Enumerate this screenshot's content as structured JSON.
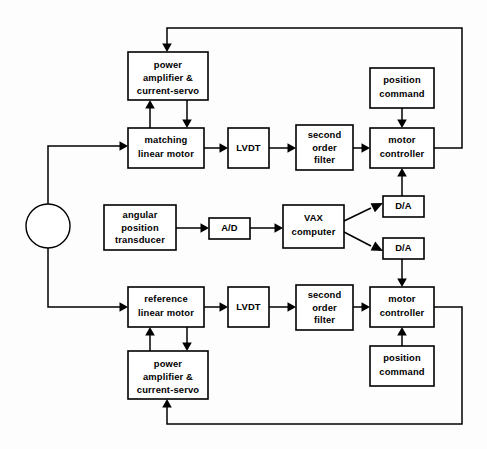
{
  "figure": {
    "kind": "control-system-block-diagram",
    "title": "",
    "background_color": "#fdfdfd",
    "line_color": "#000000",
    "box_fill": "#ffffff"
  },
  "nodes": {
    "summing_junction": {
      "shape": "circle",
      "label": ""
    },
    "top_power_amplifier": {
      "lines": [
        "power",
        "amplifier  &",
        "current-servo"
      ]
    },
    "matching_linear_motor": {
      "lines": [
        "matching",
        "linear motor"
      ]
    },
    "top_lvdt": {
      "lines": [
        "LVDT"
      ]
    },
    "top_second_order_filter": {
      "lines": [
        "second",
        "order",
        "filter"
      ]
    },
    "top_motor_controller": {
      "lines": [
        "motor",
        "controller"
      ]
    },
    "top_position_command": {
      "lines": [
        "position",
        "command"
      ]
    },
    "angular_position_transducer": {
      "lines": [
        "angular",
        "position",
        "transducer"
      ]
    },
    "ad_converter": {
      "lines": [
        "A/D"
      ]
    },
    "vax_computer": {
      "lines": [
        "VAX",
        "computer"
      ]
    },
    "da_converter_top": {
      "lines": [
        "D/A"
      ]
    },
    "da_converter_bottom": {
      "lines": [
        "D/A"
      ]
    },
    "reference_linear_motor": {
      "lines": [
        "reference",
        "linear  motor"
      ]
    },
    "bottom_lvdt": {
      "lines": [
        "LVDT"
      ]
    },
    "bottom_second_order_filter": {
      "lines": [
        "second",
        "order",
        "filter"
      ]
    },
    "bottom_motor_controller": {
      "lines": [
        "motor",
        "controller"
      ]
    },
    "bottom_position_command": {
      "lines": [
        "position",
        "command"
      ]
    },
    "bottom_power_amplifier": {
      "lines": [
        "power",
        "amplifier  &",
        "current-servo"
      ]
    }
  },
  "geometry": {
    "canvas": {
      "width": 487,
      "height": 449
    },
    "boxes": [
      {
        "id": "top_power_amplifier",
        "x": 128,
        "y": 52,
        "w": 80,
        "h": 48
      },
      {
        "id": "matching_linear_motor",
        "x": 128,
        "y": 128,
        "w": 76,
        "h": 40
      },
      {
        "id": "top_lvdt",
        "x": 228,
        "y": 128,
        "w": 41,
        "h": 40
      },
      {
        "id": "top_second_order_filter",
        "x": 296,
        "y": 125,
        "w": 57,
        "h": 45
      },
      {
        "id": "top_motor_controller",
        "x": 370,
        "y": 128,
        "w": 64,
        "h": 40
      },
      {
        "id": "top_position_command",
        "x": 370,
        "y": 68,
        "w": 64,
        "h": 40
      },
      {
        "id": "angular_position_transducer",
        "x": 104,
        "y": 205,
        "w": 72,
        "h": 45
      },
      {
        "id": "ad_converter",
        "x": 209,
        "y": 218,
        "w": 41,
        "h": 21
      },
      {
        "id": "vax_computer",
        "x": 283,
        "y": 205,
        "w": 61,
        "h": 43
      },
      {
        "id": "da_converter_top",
        "x": 383,
        "y": 196,
        "w": 41,
        "h": 21
      },
      {
        "id": "da_converter_bottom",
        "x": 383,
        "y": 238,
        "w": 41,
        "h": 21
      },
      {
        "id": "reference_linear_motor",
        "x": 128,
        "y": 287,
        "w": 76,
        "h": 40
      },
      {
        "id": "bottom_lvdt",
        "x": 228,
        "y": 287,
        "w": 41,
        "h": 40
      },
      {
        "id": "bottom_second_order_filter",
        "x": 296,
        "y": 285,
        "w": 57,
        "h": 45
      },
      {
        "id": "bottom_motor_controller",
        "x": 370,
        "y": 287,
        "w": 64,
        "h": 40
      },
      {
        "id": "bottom_position_command",
        "x": 370,
        "y": 346,
        "w": 64,
        "h": 40
      },
      {
        "id": "bottom_power_amplifier",
        "x": 128,
        "y": 351,
        "w": 80,
        "h": 48
      }
    ],
    "circle": {
      "cx": 48,
      "cy": 226,
      "r": 22
    }
  },
  "edges": [
    {
      "from": "top_motor_controller",
      "to": "top_power_amplifier",
      "label": ""
    },
    {
      "from": "top_power_amplifier",
      "to": "matching_linear_motor",
      "label": ""
    },
    {
      "from": "matching_linear_motor",
      "to": "top_power_amplifier",
      "label": ""
    },
    {
      "from": "summing_junction",
      "to": "matching_linear_motor",
      "label": ""
    },
    {
      "from": "matching_linear_motor",
      "to": "top_lvdt",
      "label": ""
    },
    {
      "from": "top_lvdt",
      "to": "top_second_order_filter",
      "label": ""
    },
    {
      "from": "top_second_order_filter",
      "to": "top_motor_controller",
      "label": ""
    },
    {
      "from": "top_position_command",
      "to": "top_motor_controller",
      "label": ""
    },
    {
      "from": "da_converter_top",
      "to": "top_motor_controller",
      "label": ""
    },
    {
      "from": "angular_position_transducer",
      "to": "ad_converter",
      "label": ""
    },
    {
      "from": "ad_converter",
      "to": "vax_computer",
      "label": ""
    },
    {
      "from": "vax_computer",
      "to": "da_converter_top",
      "label": ""
    },
    {
      "from": "vax_computer",
      "to": "da_converter_bottom",
      "label": ""
    },
    {
      "from": "da_converter_bottom",
      "to": "bottom_motor_controller",
      "label": ""
    },
    {
      "from": "summing_junction",
      "to": "reference_linear_motor",
      "label": ""
    },
    {
      "from": "reference_linear_motor",
      "to": "bottom_lvdt",
      "label": ""
    },
    {
      "from": "bottom_lvdt",
      "to": "bottom_second_order_filter",
      "label": ""
    },
    {
      "from": "bottom_second_order_filter",
      "to": "bottom_motor_controller",
      "label": ""
    },
    {
      "from": "bottom_position_command",
      "to": "bottom_motor_controller",
      "label": ""
    },
    {
      "from": "bottom_motor_controller",
      "to": "bottom_power_amplifier",
      "label": ""
    },
    {
      "from": "bottom_power_amplifier",
      "to": "reference_linear_motor",
      "label": ""
    },
    {
      "from": "reference_linear_motor",
      "to": "bottom_power_amplifier",
      "label": ""
    }
  ]
}
